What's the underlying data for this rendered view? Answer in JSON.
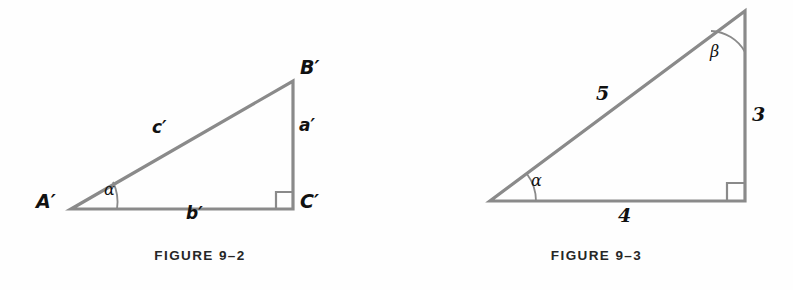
{
  "page": {
    "background_color": "#fefefe",
    "stroke_color": "#8a8a8a",
    "text_color": "#111111",
    "caption_color": "#262626"
  },
  "figures": [
    {
      "id": "figure-9-2",
      "caption": "FIGURE 9–2",
      "description": "Right triangle A'B'C' with symbolic side labels",
      "vertices": [
        {
          "name": "A-prime",
          "label": "A′",
          "x": 71,
          "y": 209,
          "label_x": 36,
          "label_y": 198
        },
        {
          "name": "B-prime",
          "label": "B′",
          "x": 293,
          "y": 81,
          "label_x": 300,
          "label_y": 62
        },
        {
          "name": "C-prime",
          "label": "C′",
          "x": 293,
          "y": 209,
          "label_x": 300,
          "label_y": 198
        }
      ],
      "sides": [
        {
          "name": "hypotenuse",
          "label": "c′",
          "label_x": 152,
          "label_y": 124
        },
        {
          "name": "opposite",
          "label": "a′",
          "label_x": 299,
          "label_y": 122
        },
        {
          "name": "adjacent",
          "label": "b′",
          "label_x": 186,
          "label_y": 206
        }
      ],
      "angles": [
        {
          "name": "alpha",
          "label": "α",
          "at_vertex": "A-prime",
          "label_x": 104,
          "label_y": 187
        },
        {
          "name": "right-angle",
          "label": "",
          "at_vertex": "C-prime"
        }
      ]
    },
    {
      "id": "figure-9-3",
      "caption": "FIGURE 9–3",
      "description": "3-4-5 right triangle with numeric side lengths",
      "vertices": [
        {
          "name": "left-vertex",
          "label": "",
          "x": 90,
          "y": 201
        },
        {
          "name": "top-vertex",
          "label": "",
          "x": 345,
          "y": 11
        },
        {
          "name": "right-angle-vertex",
          "label": "",
          "x": 345,
          "y": 201
        }
      ],
      "sides": [
        {
          "name": "hypotenuse",
          "label": "5",
          "value": 5,
          "label_x": 196,
          "label_y": 89
        },
        {
          "name": "vertical-side",
          "label": "3",
          "value": 3,
          "label_x": 348,
          "label_y": 110
        },
        {
          "name": "base-side",
          "label": "4",
          "value": 4,
          "label_x": 218,
          "label_y": 209
        }
      ],
      "angles": [
        {
          "name": "alpha",
          "label": "α",
          "at_vertex": "left-vertex",
          "label_x": 131,
          "label_y": 178
        },
        {
          "name": "beta",
          "label": "β",
          "at_vertex": "top-vertex",
          "label_x": 310,
          "label_y": 49
        },
        {
          "name": "right-angle",
          "label": "",
          "at_vertex": "right-angle-vertex"
        }
      ]
    }
  ]
}
